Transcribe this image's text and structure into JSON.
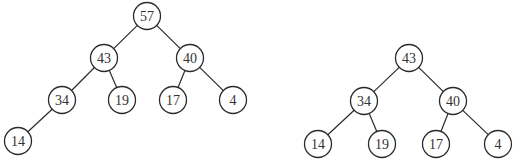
{
  "diagram": {
    "type": "binary-heap-trees",
    "node_radius": 13.5,
    "colors": {
      "stroke": "#2a2a2a",
      "text": "#333333",
      "background": "#ffffff"
    },
    "trees": [
      {
        "name": "heap-before",
        "nodes": [
          {
            "id": "a57",
            "label": "57",
            "x": 147,
            "y": 16
          },
          {
            "id": "a43",
            "label": "43",
            "x": 104,
            "y": 58
          },
          {
            "id": "a40",
            "label": "40",
            "x": 190,
            "y": 58
          },
          {
            "id": "a34",
            "label": "34",
            "x": 62,
            "y": 100
          },
          {
            "id": "a19",
            "label": "19",
            "x": 122,
            "y": 100
          },
          {
            "id": "a17",
            "label": "17",
            "x": 173,
            "y": 100
          },
          {
            "id": "a4",
            "label": "4",
            "x": 233,
            "y": 100
          },
          {
            "id": "a14",
            "label": "14",
            "x": 18,
            "y": 141
          }
        ],
        "edges": [
          [
            "a57",
            "a43"
          ],
          [
            "a57",
            "a40"
          ],
          [
            "a43",
            "a34"
          ],
          [
            "a43",
            "a19"
          ],
          [
            "a40",
            "a17"
          ],
          [
            "a40",
            "a4"
          ],
          [
            "a34",
            "a14"
          ]
        ]
      },
      {
        "name": "heap-after",
        "nodes": [
          {
            "id": "b43",
            "label": "43",
            "x": 409,
            "y": 58
          },
          {
            "id": "b34",
            "label": "34",
            "x": 364,
            "y": 101
          },
          {
            "id": "b40",
            "label": "40",
            "x": 453,
            "y": 101
          },
          {
            "id": "b14",
            "label": "14",
            "x": 318,
            "y": 144
          },
          {
            "id": "b19",
            "label": "19",
            "x": 382,
            "y": 144
          },
          {
            "id": "b17",
            "label": "17",
            "x": 436,
            "y": 144
          },
          {
            "id": "b4",
            "label": "4",
            "x": 498,
            "y": 144
          }
        ],
        "edges": [
          [
            "b43",
            "b34"
          ],
          [
            "b43",
            "b40"
          ],
          [
            "b34",
            "b14"
          ],
          [
            "b34",
            "b19"
          ],
          [
            "b40",
            "b17"
          ],
          [
            "b40",
            "b4"
          ]
        ]
      }
    ]
  }
}
